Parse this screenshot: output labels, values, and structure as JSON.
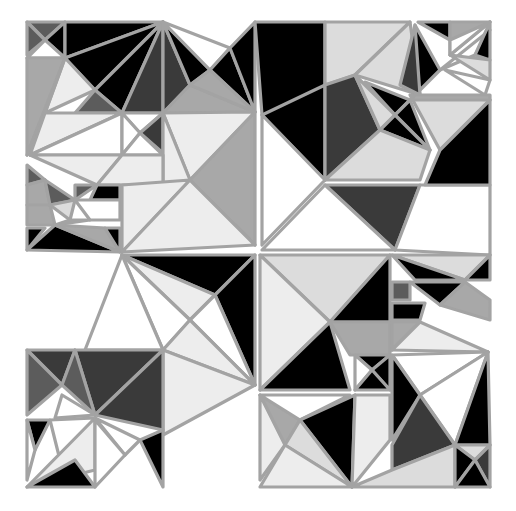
{
  "canvas": {
    "width": 516,
    "height": 511,
    "background": "#ffffff"
  },
  "palette": {
    "K": "#000000",
    "D": "#3a3a3a",
    "M": "#5c5c5c",
    "G": "#a8a8a8",
    "L": "#dcdcdc",
    "P": "#ededed",
    "W": "#ffffff",
    "stroke": "#a3a3a3"
  },
  "polygons": [
    {
      "c": "M",
      "p": "27,22 65,22 45,40"
    },
    {
      "c": "M",
      "p": "27,22 45,40 27,55"
    },
    {
      "c": "K",
      "p": "65,22 45,40 65,58"
    },
    {
      "c": "W",
      "p": "27,58 45,40 65,58"
    },
    {
      "c": "K",
      "p": "65,22 163,22 65,58"
    },
    {
      "c": "K",
      "p": "65,58 163,22 95,90"
    },
    {
      "c": "K",
      "p": "95,90 163,22 122,113"
    },
    {
      "c": "D",
      "p": "163,22 122,113 163,113"
    },
    {
      "c": "D",
      "p": "163,22 163,113 190,85"
    },
    {
      "c": "K",
      "p": "163,22 190,85 210,70"
    },
    {
      "c": "W",
      "p": "163,22 230,48 210,70"
    },
    {
      "c": "K",
      "p": "230,48 210,70 255,112"
    },
    {
      "c": "K",
      "p": "230,48 255,22 255,112"
    },
    {
      "c": "G",
      "p": "190,85 163,113 255,112"
    },
    {
      "c": "G",
      "p": "190,85 210,70 255,112"
    },
    {
      "c": "G",
      "p": "27,58 65,58 27,155"
    },
    {
      "c": "P",
      "p": "65,58 95,90 45,113"
    },
    {
      "c": "P",
      "p": "65,58 45,113 27,155"
    },
    {
      "c": "M",
      "p": "95,90 122,113 75,113"
    },
    {
      "c": "P",
      "p": "45,113 122,113 30,155"
    },
    {
      "c": "W",
      "p": "122,113 30,155 122,155"
    },
    {
      "c": "W",
      "p": "122,113 163,113 140,133"
    },
    {
      "c": "D",
      "p": "140,133 163,113 163,153"
    },
    {
      "c": "W",
      "p": "122,113 140,133 122,155"
    },
    {
      "c": "W",
      "p": "122,155 140,133 163,155"
    },
    {
      "c": "P",
      "p": "163,113 255,112 190,180"
    },
    {
      "c": "P",
      "p": "163,113 163,185 190,180"
    },
    {
      "c": "G",
      "p": "255,112 190,180 255,245"
    },
    {
      "c": "P",
      "p": "30,155 122,155 97,185"
    },
    {
      "c": "P",
      "p": "122,155 163,155 163,185 97,185"
    },
    {
      "c": "M",
      "p": "27,165 45,180 27,185"
    },
    {
      "c": "G",
      "p": "27,185 45,180 50,205 27,205"
    },
    {
      "c": "M",
      "p": "45,180 75,200 50,205"
    },
    {
      "c": "M",
      "p": "75,185 97,185 75,200"
    },
    {
      "c": "K",
      "p": "97,185 120,185 120,200 90,200"
    },
    {
      "c": "G",
      "p": "27,205 50,205 55,225 27,225"
    },
    {
      "c": "L",
      "p": "50,205 75,200 70,220"
    },
    {
      "c": "W",
      "p": "75,200 120,200 120,220 90,220"
    },
    {
      "c": "L",
      "p": "70,220 90,220 55,225"
    },
    {
      "c": "K",
      "p": "27,228 45,228 27,250"
    },
    {
      "c": "K",
      "p": "27,250 120,252 55,225"
    },
    {
      "c": "G",
      "p": "55,225 105,228 120,252"
    },
    {
      "c": "K",
      "p": "105,228 120,228 120,252"
    },
    {
      "c": "P",
      "p": "122,185 190,180 122,252"
    },
    {
      "c": "P",
      "p": "190,180 255,245 122,252"
    },
    {
      "c": "K",
      "p": "122,255 255,255 215,295"
    },
    {
      "c": "P",
      "p": "122,255 215,295 190,320"
    },
    {
      "c": "K",
      "p": "215,295 255,255 255,385"
    },
    {
      "c": "W",
      "p": "190,320 215,295 255,385"
    },
    {
      "c": "W",
      "p": "122,255 190,320 163,350"
    },
    {
      "c": "P",
      "p": "163,350 190,320 255,385"
    },
    {
      "c": "P",
      "p": "163,350 255,385 163,435"
    },
    {
      "c": "W",
      "p": "122,255 85,350 163,350"
    },
    {
      "c": "D",
      "p": "27,350 75,350 62,385"
    },
    {
      "c": "M",
      "p": "27,350 62,385 27,415"
    },
    {
      "c": "D",
      "p": "75,350 163,350 95,415"
    },
    {
      "c": "M",
      "p": "62,385 75,350 95,415"
    },
    {
      "c": "W",
      "p": "62,395 95,415 55,418"
    },
    {
      "c": "D",
      "p": "95,415 163,350 163,430"
    },
    {
      "c": "K",
      "p": "27,420 50,420 35,450"
    },
    {
      "c": "W",
      "p": "27,420 35,450 27,480"
    },
    {
      "c": "W",
      "p": "50,420 95,418 60,460"
    },
    {
      "c": "P",
      "p": "27,487 95,418 95,470"
    },
    {
      "c": "K",
      "p": "27,487 95,487 75,460"
    },
    {
      "c": "W",
      "p": "95,418 140,440 125,455"
    },
    {
      "c": "K",
      "p": "140,440 163,430 163,487"
    },
    {
      "c": "W",
      "p": "95,420 125,455 95,487"
    },
    {
      "c": "K",
      "p": "255,22 325,22 325,110 262,115"
    },
    {
      "c": "L",
      "p": "325,22 410,22 355,75 325,85"
    },
    {
      "c": "L",
      "p": "410,22 420,95 355,75"
    },
    {
      "c": "K",
      "p": "262,115 325,85 325,180"
    },
    {
      "c": "W",
      "p": "262,115 325,180 262,245"
    },
    {
      "c": "D",
      "p": "325,85 355,75 380,130 325,180"
    },
    {
      "c": "K",
      "p": "365,82 410,100 395,115"
    },
    {
      "c": "L",
      "p": "355,75 395,115 380,130"
    },
    {
      "c": "K",
      "p": "395,115 410,100 430,150"
    },
    {
      "c": "K",
      "p": "380,130 395,115 430,150"
    },
    {
      "c": "L",
      "p": "325,180 380,130 430,150 420,180"
    },
    {
      "c": "D",
      "p": "325,185 420,185 395,250"
    },
    {
      "c": "W",
      "p": "262,250 325,185 395,250"
    },
    {
      "c": "W",
      "p": "420,185 490,185 490,255 395,250"
    },
    {
      "c": "L",
      "p": "410,95 490,100 440,150"
    },
    {
      "c": "K",
      "p": "440,150 490,100 490,185 425,185"
    },
    {
      "c": "K",
      "p": "418,22 450,22 450,40"
    },
    {
      "c": "G",
      "p": "450,22 490,22 450,55"
    },
    {
      "c": "W",
      "p": "450,40 490,22 450,55"
    },
    {
      "c": "K",
      "p": "415,25 440,70 415,95"
    },
    {
      "c": "D",
      "p": "415,25 420,95 400,85"
    },
    {
      "c": "W",
      "p": "440,70 490,30 475,55"
    },
    {
      "c": "L",
      "p": "450,55 490,60 490,80"
    },
    {
      "c": "W",
      "p": "445,70 490,80 485,95"
    },
    {
      "c": "G",
      "p": "415,95 490,95 490,100 410,100"
    },
    {
      "c": "K",
      "p": "490,22 490,60 475,55"
    },
    {
      "c": "L",
      "p": "260,255 390,255 330,322"
    },
    {
      "c": "P",
      "p": "260,255 330,322 260,390"
    },
    {
      "c": "K",
      "p": "330,322 390,255 390,322"
    },
    {
      "c": "K",
      "p": "260,390 330,322 350,390"
    },
    {
      "c": "G",
      "p": "330,322 390,322 390,355 350,355"
    },
    {
      "c": "K",
      "p": "355,355 390,355 372,370"
    },
    {
      "c": "W",
      "p": "355,355 372,370 355,390"
    },
    {
      "c": "K",
      "p": "372,370 390,355 390,390"
    },
    {
      "c": "K",
      "p": "355,390 372,370 390,390"
    },
    {
      "c": "L",
      "p": "392,255 490,255 465,280"
    },
    {
      "c": "K",
      "p": "465,280 490,255 490,280"
    },
    {
      "c": "K",
      "p": "392,255 465,280 415,280"
    },
    {
      "c": "M",
      "p": "392,282 410,282 410,300 392,300"
    },
    {
      "c": "K",
      "p": "410,282 465,282 440,305"
    },
    {
      "c": "G",
      "p": "440,305 465,282 490,300 490,320"
    },
    {
      "c": "K",
      "p": "392,303 425,303 420,320 392,320"
    },
    {
      "c": "G",
      "p": "392,322 420,322 392,350"
    },
    {
      "c": "P",
      "p": "420,322 488,352 392,350"
    },
    {
      "c": "W",
      "p": "392,355 488,352 420,395"
    },
    {
      "c": "K",
      "p": "392,355 420,395 392,440"
    },
    {
      "c": "W",
      "p": "420,395 488,352 455,445"
    },
    {
      "c": "K",
      "p": "455,445 488,352 490,445"
    },
    {
      "c": "D",
      "p": "392,445 420,395 455,445 392,470"
    },
    {
      "c": "G",
      "p": "260,395 300,420 285,445"
    },
    {
      "c": "W",
      "p": "260,395 350,395 300,420"
    },
    {
      "c": "P",
      "p": "260,395 285,445 260,480"
    },
    {
      "c": "K",
      "p": "300,420 355,395 352,487"
    },
    {
      "c": "L",
      "p": "285,445 300,420 352,487"
    },
    {
      "c": "P",
      "p": "260,487 285,445 352,487"
    },
    {
      "c": "P",
      "p": "355,395 390,395 390,440 352,487"
    },
    {
      "c": "L",
      "p": "352,487 392,470 455,445 455,487"
    },
    {
      "c": "L",
      "p": "455,445 490,445 475,460"
    },
    {
      "c": "K",
      "p": "455,445 475,460 455,487"
    },
    {
      "c": "D",
      "p": "475,460 490,445 490,487"
    },
    {
      "c": "K",
      "p": "455,487 475,460 490,487"
    }
  ],
  "lines": [
    "27,155 122,155",
    "122,22 122,252",
    "163,22 255,112",
    "255,112 255,487",
    "122,252 255,385",
    "122,252 85,350",
    "255,385 120,250"
  ]
}
